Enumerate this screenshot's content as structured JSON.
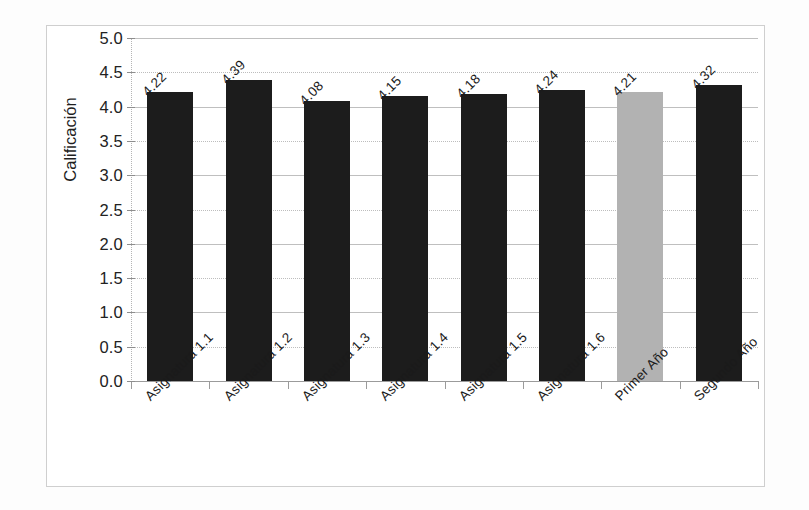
{
  "figure": {
    "background_color": "#ffffff",
    "frame_color": "#cfcfcf"
  },
  "chart_data": {
    "type": "bar",
    "title": "",
    "xlabel": "",
    "ylabel": "Calificación",
    "ylim": [
      0.0,
      5.0
    ],
    "ytick_step": 0.5,
    "grid": true,
    "legend": "none",
    "categories": [
      "Asignatura 1.1",
      "Asignatura 1.2",
      "Asignatura 1.3",
      "Asignatura 1.4",
      "Asignatura 1.5",
      "Asignatura 1.6",
      "Primer Año",
      "Segundo Año"
    ],
    "values": [
      4.22,
      4.39,
      4.08,
      4.15,
      4.18,
      4.24,
      4.21,
      4.32
    ],
    "value_labels": [
      "4.22",
      "4.39",
      "4.08",
      "4.15",
      "4.18",
      "4.24",
      "4.21",
      "4.32"
    ],
    "bar_colors": [
      "#1c1c1c",
      "#1c1c1c",
      "#1c1c1c",
      "#1c1c1c",
      "#1c1c1c",
      "#1c1c1c",
      "#b2b2b2",
      "#1c1c1c"
    ],
    "ytick_labels": [
      "0.0",
      "0.5",
      "1.0",
      "1.5",
      "2.0",
      "2.5",
      "3.0",
      "3.5",
      "4.0",
      "4.5",
      "5.0"
    ],
    "ytick_values": [
      0.0,
      0.5,
      1.0,
      1.5,
      2.0,
      2.5,
      3.0,
      3.5,
      4.0,
      4.5,
      5.0
    ]
  }
}
